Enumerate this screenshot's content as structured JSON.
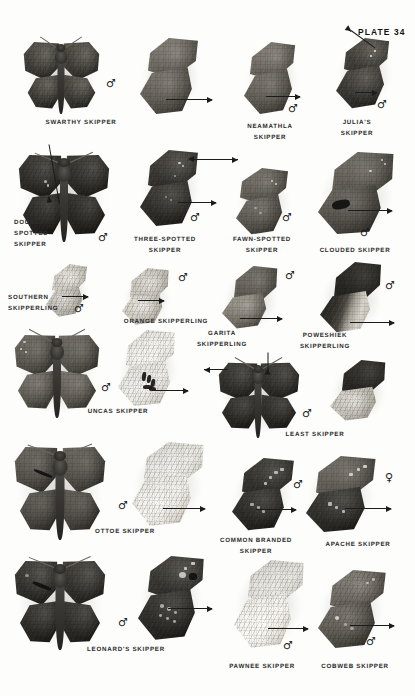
{
  "plate": {
    "title": "PLATE 34",
    "background_color": "#fdfdfb",
    "ink_color": "#2c2c2c"
  },
  "symbols": {
    "male": "♂",
    "female": "♀"
  },
  "specimens": [
    {
      "id": "swarthy-skipper",
      "label": "SWARTHY SKIPPER",
      "lines": [
        "SWARTHY SKIPPER"
      ],
      "sex": "♂",
      "views": [
        "dorsal-spread",
        "ventral-lateral"
      ]
    },
    {
      "id": "neamathla-skipper",
      "label": "NEAMATHLA SKIPPER",
      "lines": [
        "NEAMATHLA",
        "SKIPPER"
      ],
      "sex": "♂",
      "views": [
        "ventral-lateral"
      ]
    },
    {
      "id": "julias-skipper",
      "label": "JULIA'S SKIPPER",
      "lines": [
        "JULIA'S",
        "SKIPPER"
      ],
      "sex": "♂",
      "views": [
        "ventral-lateral"
      ]
    },
    {
      "id": "double-spotted-skipper",
      "label": "DOUBLE-SPOTTED SKIPPER",
      "lines": [
        "DOUBLE-",
        "SPOTTED",
        "SKIPPER"
      ],
      "sex": "♂",
      "views": [
        "dorsal-spread"
      ]
    },
    {
      "id": "three-spotted-skipper",
      "label": "THREE-SPOTTED SKIPPER",
      "lines": [
        "THREE-SPOTTED",
        "SKIPPER"
      ],
      "sex": "♂",
      "views": [
        "ventral-lateral"
      ]
    },
    {
      "id": "fawn-spotted-skipper",
      "label": "FAWN-SPOTTED SKIPPER",
      "lines": [
        "FAWN-SPOTTED",
        "SKIPPER"
      ],
      "sex": "♂",
      "views": [
        "ventral-lateral"
      ]
    },
    {
      "id": "clouded-skipper",
      "label": "CLOUDED SKIPPER",
      "lines": [
        "CLOUDED SKIPPER"
      ],
      "sex": "♂",
      "views": [
        "ventral-lateral"
      ]
    },
    {
      "id": "southern-skipperling",
      "label": "SOUTHERN SKIPPERLING",
      "lines": [
        "SOUTHERN",
        "SKIPPERLING"
      ],
      "sex": "♂",
      "views": [
        "ventral-lateral"
      ]
    },
    {
      "id": "orange-skipperling",
      "label": "ORANGE SKIPPERLING",
      "lines": [
        "ORANGE SKIPPERLING"
      ],
      "sex": "♂",
      "views": [
        "ventral-lateral"
      ]
    },
    {
      "id": "garita-skipperling",
      "label": "GARITA SKIPPERLING",
      "lines": [
        "GARITA",
        "SKIPPERLING"
      ],
      "sex": "♂",
      "views": [
        "ventral-lateral"
      ]
    },
    {
      "id": "poweshiek-skipperling",
      "label": "POWESHIEK SKIPPERLING",
      "lines": [
        "POWESHIEK",
        "SKIPPERLING"
      ],
      "sex": "♂",
      "views": [
        "ventral-lateral"
      ]
    },
    {
      "id": "uncas-skipper",
      "label": "UNCAS SKIPPER",
      "lines": [
        "UNCAS SKIPPER"
      ],
      "sex": "♂",
      "views": [
        "dorsal-spread",
        "ventral-lateral"
      ]
    },
    {
      "id": "least-skipper",
      "label": "LEAST SKIPPER",
      "lines": [
        "LEAST SKIPPER"
      ],
      "sex": "♂",
      "views": [
        "dorsal-spread",
        "ventral-lateral"
      ]
    },
    {
      "id": "ottoe-skipper",
      "label": "OTTOE SKIPPER",
      "lines": [
        "OTTOE SKIPPER"
      ],
      "sex": "♂",
      "views": [
        "dorsal-spread",
        "ventral-lateral"
      ]
    },
    {
      "id": "common-branded-skipper",
      "label": "COMMON BRANDED SKIPPER",
      "lines": [
        "COMMON BRANDED",
        "SKIPPER"
      ],
      "sex": "♂",
      "views": [
        "ventral-lateral"
      ]
    },
    {
      "id": "apache-skipper",
      "label": "APACHE SKIPPER",
      "lines": [
        "APACHE SKIPPER"
      ],
      "sex": "♀",
      "views": [
        "ventral-lateral"
      ]
    },
    {
      "id": "leonards-skipper",
      "label": "LEONARD'S SKIPPER",
      "lines": [
        "LEONARD'S SKIPPER"
      ],
      "sex": "♂",
      "views": [
        "dorsal-spread",
        "ventral-lateral"
      ]
    },
    {
      "id": "pawnee-skipper",
      "label": "PAWNEE SKIPPER",
      "lines": [
        "PAWNEE SKIPPER"
      ],
      "sex": "♂",
      "views": [
        "ventral-lateral"
      ]
    },
    {
      "id": "cobweb-skipper",
      "label": "COBWEB SKIPPER",
      "lines": [
        "COBWEB SKIPPER"
      ],
      "sex": "♂",
      "views": [
        "ventral-lateral"
      ]
    }
  ],
  "captions": {
    "swarthy": "SWARTHY SKIPPER",
    "neamathla_1": "NEAMATHLA",
    "neamathla_2": "SKIPPER",
    "julias_1": "JULIA'S",
    "julias_2": "SKIPPER",
    "double_1": "DOUBLE-",
    "double_2": "SPOTTED",
    "double_3": "SKIPPER",
    "three_1": "THREE-SPOTTED",
    "three_2": "SKIPPER",
    "fawn_1": "FAWN-SPOTTED",
    "fawn_2": "SKIPPER",
    "clouded": "CLOUDED SKIPPER",
    "southern_1": "SOUTHERN",
    "southern_2": "SKIPPERLING",
    "orange": "ORANGE SKIPPERLING",
    "garita_1": "GARITA",
    "garita_2": "SKIPPERLING",
    "poweshiek_1": "POWESHIEK",
    "poweshiek_2": "SKIPPERLING",
    "uncas": "UNCAS SKIPPER",
    "least": "LEAST SKIPPER",
    "ottoe": "OTTOE SKIPPER",
    "commonbranded_1": "COMMON BRANDED",
    "commonbranded_2": "SKIPPER",
    "apache": "APACHE SKIPPER",
    "leonards": "LEONARD'S SKIPPER",
    "pawnee": "PAWNEE SKIPPER",
    "cobweb": "COBWEB SKIPPER"
  }
}
